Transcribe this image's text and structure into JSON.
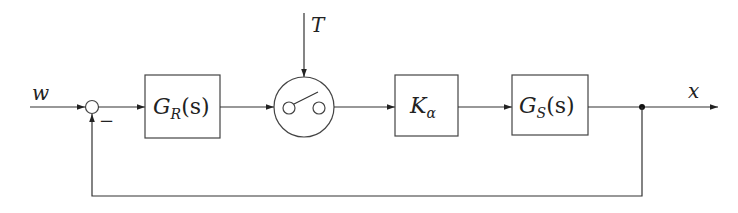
{
  "diagram": {
    "type": "control-loop-block-diagram",
    "input_signal": "w",
    "output_signal": "x",
    "disturbance_trigger": "T",
    "summing_junction": {
      "feedback_sign": "−"
    },
    "blocks": [
      {
        "id": "controller",
        "main": "G",
        "sub": "R",
        "arg": "(s)"
      },
      {
        "id": "switch",
        "kind": "sampler-switch"
      },
      {
        "id": "gain",
        "main": "K",
        "sub": "α",
        "arg": ""
      },
      {
        "id": "plant",
        "main": "G",
        "sub": "S",
        "arg": "(s)"
      }
    ],
    "feedback": "unity negative feedback from x to summing junction"
  }
}
